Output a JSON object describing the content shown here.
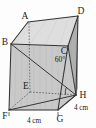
{
  "figure": {
    "background_color": "#fdfdfd",
    "line_color": "#3a3a3a",
    "face_fill_front": "#c9c9c9",
    "face_fill_side": "#b5b5b5",
    "face_fill_top": "#dedede",
    "face_fill_base": "#bdbdbd",
    "vertices": {
      "A": "A",
      "B": "B",
      "C": "C",
      "D": "D",
      "E": "E",
      "F": "F",
      "G": "G",
      "H": "H"
    },
    "angle": {
      "value": "60",
      "degree_symbol": "°",
      "text": "60°",
      "at_vertex": "H"
    },
    "dimensions": [
      {
        "id": "base-front-width",
        "text": "4 cm",
        "edge": "FG"
      },
      {
        "id": "base-right-depth",
        "text": "4 cm",
        "edge": "GH"
      }
    ]
  }
}
